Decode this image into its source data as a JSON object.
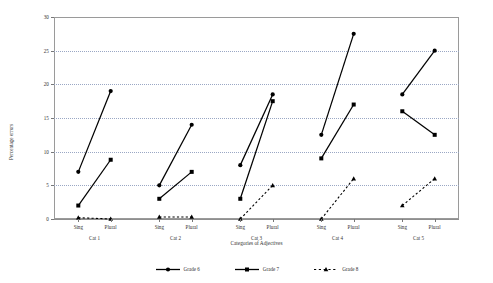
{
  "chart_data": {
    "type": "line",
    "title": "",
    "xlabel": "Categories of Adjectives",
    "ylabel": "Percentage errors",
    "ylim": [
      0,
      30
    ],
    "ytick_values": [
      0,
      5,
      10,
      15,
      20,
      25,
      30
    ],
    "ytick_labels": [
      "0",
      "5",
      "10",
      "15",
      "20",
      "25",
      "30"
    ],
    "grid": "horizontal-dotted",
    "legend_position": "bottom-center",
    "x_ticklabels": [
      "Sing",
      "Plural",
      "Sing",
      "Plural",
      "Sing",
      "Plural",
      "Sing",
      "Plural",
      "Sing",
      "Plural"
    ],
    "group_labels": [
      "Cat 1",
      "Cat 2",
      "Cat 3",
      "Cat 4",
      "Cat 5"
    ],
    "categories": [
      "Cat 1 Sing",
      "Cat 1 Plural",
      "Cat 2 Sing",
      "Cat 2 Plural",
      "Cat 3 Sing",
      "Cat 3 Plural",
      "Cat 4 Sing",
      "Cat 4 Plural",
      "Cat 5 Sing",
      "Cat 5 Plural"
    ],
    "series": [
      {
        "name": "Grade 6",
        "marker": "circle",
        "linestyle": "solid",
        "color": "#000000",
        "values": [
          7,
          19,
          5,
          14,
          8,
          18.5,
          12.5,
          27.5,
          18.5,
          25
        ]
      },
      {
        "name": "Grade 7",
        "marker": "square",
        "linestyle": "solid",
        "color": "#000000",
        "values": [
          2,
          8.8,
          3,
          7,
          3,
          17.5,
          9,
          17,
          16,
          12.5
        ]
      },
      {
        "name": "Grade 8",
        "marker": "triangle",
        "linestyle": "dotted",
        "color": "#000000",
        "values": [
          0.2,
          0,
          0.3,
          0.3,
          0,
          5,
          0,
          6,
          2,
          6
        ]
      }
    ]
  },
  "legend": {
    "items": [
      {
        "label": "Grade 6",
        "marker": "circle",
        "linestyle": "solid"
      },
      {
        "label": "Grade 7",
        "marker": "square",
        "linestyle": "solid"
      },
      {
        "label": "Grade 8",
        "marker": "triangle",
        "linestyle": "dotted"
      }
    ]
  },
  "axes": {
    "y_title": "Percentage errors",
    "x_title": "Categories of Adjectives"
  }
}
